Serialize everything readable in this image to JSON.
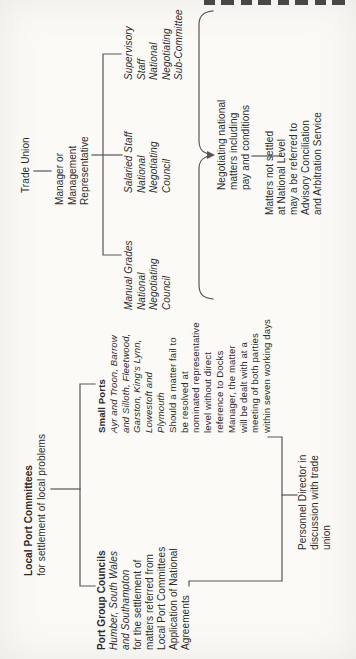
{
  "page": {
    "kind": "scanned organisation chart, rotated 90 degrees on page",
    "colors": {
      "paper": "#fbfaf7",
      "ink": "#2b2b2b",
      "line": "#565656"
    }
  },
  "chart": {
    "blocks": {
      "trade_union": {
        "lines": [
          "Trade Union"
        ]
      },
      "manager_rep": {
        "lines": [
          "Manager or",
          "Management",
          "Representative"
        ]
      },
      "manual_grades": {
        "lines": [
          "Manual Grades",
          "National",
          "Negotiating",
          "Council"
        ]
      },
      "salaried": {
        "lines": [
          "Salaried Staff",
          "National",
          "Negotiating",
          "Council"
        ]
      },
      "supervisory": {
        "lines": [
          "Supervisory",
          "Staff",
          "National",
          "Negotiating",
          "Sub-Committee"
        ]
      },
      "negotiating_national": {
        "lines": [
          "Negotiating national",
          "matters including",
          "pay and conditions"
        ]
      },
      "matters": {
        "lines": [
          "Matters not settled",
          "at National Level",
          "may a be referred to",
          "Advisory Conciliation",
          "and Arbitration Service"
        ]
      },
      "lpc": {
        "heading": "Local Port Committees",
        "sub": "for settlement of local problems"
      },
      "pgc": {
        "heading": "Port Group Councils",
        "italic": [
          "Humber, South Wales",
          "and Southampton"
        ],
        "body": [
          "for the settlement of",
          "matters referred from",
          "Local Port Committees",
          "Application of National",
          "Agreements"
        ]
      },
      "small_ports": {
        "heading": "Small Ports",
        "italic": [
          "Ayr and Troon, Barrow",
          "and Silloth, Fleetwood,",
          "Garston, King's Lynn,",
          "Lowestoft and",
          "Plymouth"
        ],
        "body": [
          "Should a matter fail to",
          "be resolved at",
          "nominated representative",
          "level without direct",
          "reference to Docks",
          "Manager, the matter",
          "will be dealt with at a",
          "meeting of both parties",
          "within seven working days"
        ]
      },
      "personnel": {
        "lines": [
          "Personnel Director in",
          "discussion with trade",
          "union"
        ]
      }
    }
  }
}
